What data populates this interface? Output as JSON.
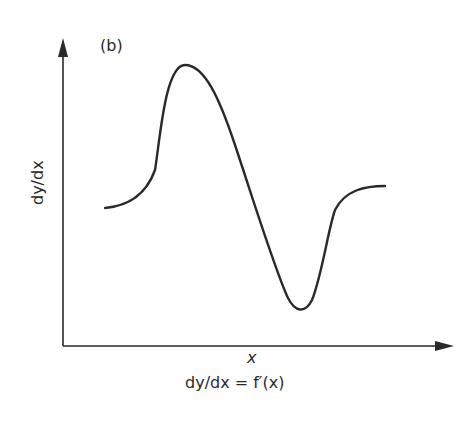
{
  "panel_label": "(b)",
  "y_axis_label": "dy/dx",
  "x_axis_label": "x",
  "caption": "dy/dx = f′(x)",
  "colors": {
    "line": "#2a2a2a",
    "background": "#ffffff"
  }
}
